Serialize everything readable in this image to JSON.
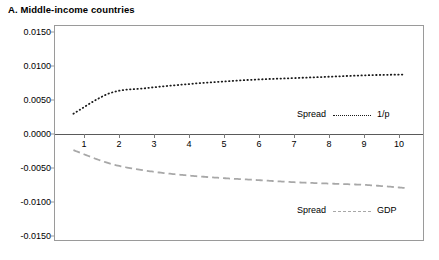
{
  "chart_data": {
    "type": "line",
    "title": "A. Middle-income countries",
    "xlabel": "",
    "ylabel": "",
    "xlim": [
      0.5,
      10.5
    ],
    "ylim": [
      -0.015,
      0.015
    ],
    "grid": false,
    "legend_position": "inside",
    "x": [
      1,
      2,
      3,
      4,
      5,
      6,
      7,
      8,
      9,
      10
    ],
    "xticklabels": [
      "1",
      "2",
      "3",
      "4",
      "5",
      "6",
      "7",
      "8",
      "9",
      "10"
    ],
    "yticklabels": [
      "0.0150",
      "0.0100",
      "0.0050",
      "0.0000",
      "-0.0050",
      "-0.0100",
      "-0.0150"
    ],
    "ytickvalues": [
      0.015,
      0.01,
      0.005,
      0.0,
      -0.005,
      -0.01,
      -0.015
    ],
    "series": [
      {
        "name": "Spread ---- 1/p",
        "label_left": "Spread",
        "label_right": "1/p",
        "style": "dotted",
        "color": "#1a1a1a",
        "values": [
          0.0027,
          0.0056,
          0.0063,
          0.0068,
          0.0072,
          0.0075,
          0.0077,
          0.0079,
          0.0081,
          0.0082
        ]
      },
      {
        "name": "Spread ---- GDP",
        "label_left": "Spread",
        "label_right": "GDP",
        "style": "dashed",
        "color": "#a8a8a8",
        "values": [
          -0.0024,
          -0.0043,
          -0.0053,
          -0.0059,
          -0.0063,
          -0.0066,
          -0.0069,
          -0.0071,
          -0.0073,
          -0.0077
        ]
      }
    ],
    "annotations": [
      {
        "text": "Spread",
        "series": 0
      },
      {
        "text": "1/p",
        "series": 0
      },
      {
        "text": "Spread",
        "series": 1
      },
      {
        "text": "GDP",
        "series": 1
      }
    ]
  }
}
